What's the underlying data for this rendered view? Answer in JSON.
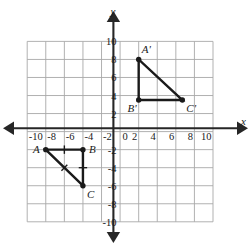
{
  "chart_data": {
    "type": "scatter",
    "title": "",
    "xlabel": "x",
    "ylabel": "y",
    "xlim": [
      -10,
      10
    ],
    "ylim": [
      -10,
      10
    ],
    "grid": true,
    "grid_step": 2,
    "legend": "none",
    "x_ticks": [
      "-10",
      "-8",
      "-6",
      "-4",
      "-2",
      "0",
      "2",
      "4",
      "6",
      "8",
      "10"
    ],
    "y_ticks": [
      "10",
      "8",
      "6",
      "4",
      "2",
      "0",
      "-2",
      "-4",
      "-6",
      "-8",
      "-10"
    ],
    "x_tick_values": [
      -10,
      -8,
      -6,
      -4,
      -2,
      0,
      2,
      4,
      6,
      8,
      10
    ],
    "y_tick_values": [
      10,
      8,
      6,
      4,
      2,
      0,
      -2,
      -4,
      -6,
      -8,
      -10
    ],
    "origin_label": "0",
    "annotations": [
      {
        "name": "triangle-ABC",
        "vertices": [
          {
            "label": "A",
            "x": -8,
            "y": -2,
            "label_pos": "left"
          },
          {
            "label": "B",
            "x": -4,
            "y": -2,
            "label_pos": "right"
          },
          {
            "label": "C",
            "x": -4,
            "y": -6,
            "label_pos": "below-right"
          }
        ],
        "congruence_marks": [
          "AB-single",
          "BC-single",
          "AC-single-slant"
        ]
      },
      {
        "name": "triangle-A-prime-B-prime-C-prime",
        "vertices": [
          {
            "label": "A'",
            "x": 2,
            "y": 8,
            "label_pos": "above-right"
          },
          {
            "label": "B'",
            "x": 2,
            "y": 3.5,
            "label_pos": "below-left"
          },
          {
            "label": "C'",
            "x": 6.7,
            "y": 3.5,
            "label_pos": "below-right"
          }
        ],
        "congruence_marks": []
      }
    ]
  },
  "axes": {
    "x_axis_name": "x",
    "y_axis_name": "y"
  },
  "colors": {
    "grid": "#a8a8a8",
    "axis": "#262626",
    "figure": "#1a1a1a",
    "background": "#ffffff"
  }
}
